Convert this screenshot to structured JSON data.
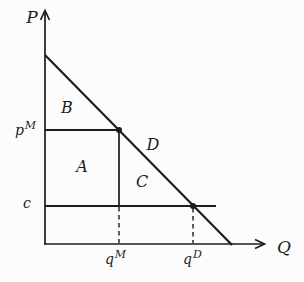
{
  "figure": {
    "background_color": "#fcfcfc",
    "line_color": "#1c1c1c",
    "labels": {
      "y_axis": "P",
      "x_axis": "Q",
      "region_b": "B",
      "region_a": "A",
      "region_c": "C",
      "region_d": "D",
      "monopoly_price_base": "p",
      "monopoly_price_sup": "M",
      "marginal_cost": "c",
      "monopoly_quantity_base": "q",
      "monopoly_quantity_sup": "M",
      "demand_quantity_base": "q",
      "demand_quantity_sup": "D"
    }
  }
}
